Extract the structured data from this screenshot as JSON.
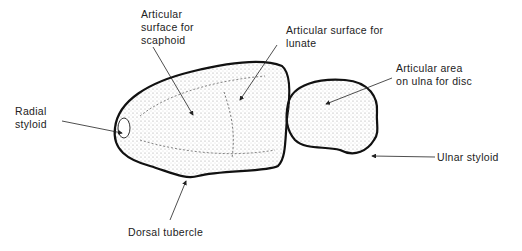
{
  "diagram": {
    "labels": {
      "scaphoid": "Articular\nsurface for\nscaphoid",
      "lunate": "Articular surface for\nlunate",
      "radial_styloid": "Radial\nstyloid",
      "ulna_disc": "Articular area\non ulna for disc",
      "ulnar_styloid": "Ulnar styloid",
      "dorsal_tubercle": "Dorsal tubercle"
    }
  }
}
